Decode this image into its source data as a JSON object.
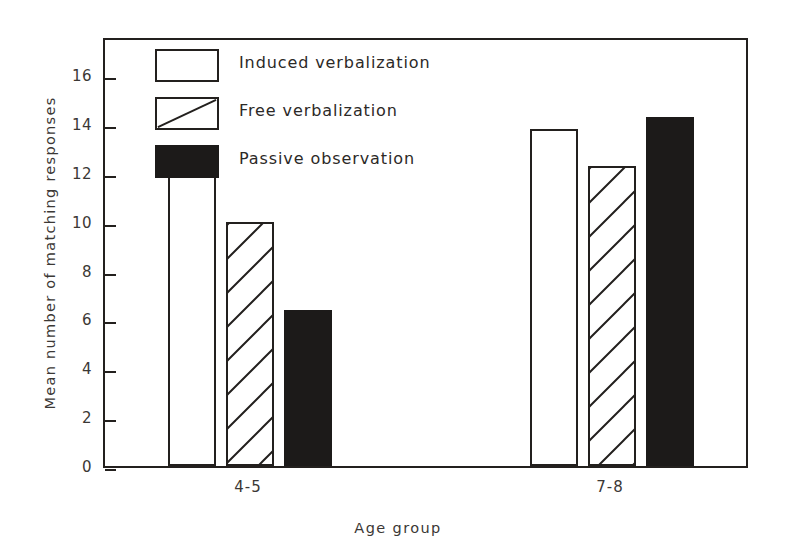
{
  "chart_data": {
    "type": "bar",
    "title": "",
    "xlabel": "Age group",
    "ylabel": "Mean number of matching responses",
    "categories": [
      "4-5",
      "7-8"
    ],
    "series": [
      {
        "name": "Induced verbalization",
        "values": [
          12.0,
          13.8
        ],
        "style": "open",
        "color": "#ffffff"
      },
      {
        "name": "Free verbalization",
        "values": [
          10.0,
          12.3
        ],
        "style": "hatched",
        "color": "#ffffff"
      },
      {
        "name": "Passive observation",
        "values": [
          6.4,
          14.3
        ],
        "style": "solid",
        "color": "#1c1a19"
      }
    ],
    "ylim": [
      0,
      17.6
    ],
    "yticks": [
      0,
      2,
      4,
      6,
      8,
      10,
      12,
      14,
      16
    ],
    "ytick_labels": [
      "0",
      "2",
      "4",
      "6",
      "8",
      "10",
      "12",
      "14",
      "16"
    ],
    "grid": false,
    "legend_position": "top-left-inside",
    "axis_color": "#23201e"
  },
  "legend": {
    "items": [
      {
        "label": "Induced verbalization",
        "swatch": "open-square-icon"
      },
      {
        "label": "Free verbalization",
        "swatch": "hatched-square-icon"
      },
      {
        "label": "Passive observation",
        "swatch": "filled-square-icon"
      }
    ]
  }
}
